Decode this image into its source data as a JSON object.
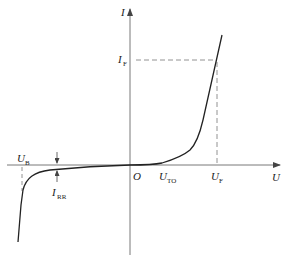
{
  "diagram": {
    "colors": {
      "axis": "#555555",
      "curve": "#222222",
      "dashed": "#777777"
    },
    "axes": {
      "x_label": "U",
      "y_label": "I",
      "origin_label": "O"
    },
    "labels": {
      "forward_current": {
        "main": "I",
        "sub": "F"
      },
      "forward_voltage": {
        "main": "U",
        "sub": "F"
      },
      "threshold_voltage": {
        "main": "U",
        "sub": "TO"
      },
      "breakdown_voltage": {
        "main": "U",
        "sub": "B"
      },
      "reverse_current": {
        "main": "I",
        "sub": "RR"
      }
    }
  }
}
